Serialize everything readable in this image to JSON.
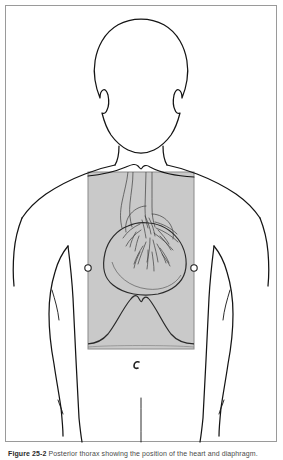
{
  "figure": {
    "caption_number": "Figure 25-2",
    "caption_text": "Posterior thorax showing the position of the heart and diaphragm.",
    "view": "posterior",
    "body_outline_color": "#1a1a1a",
    "overlay_fill": "#c9c9c9",
    "overlay_border": "#8a8a8a",
    "frame_color": "#9a9a9a",
    "background": "#ffffff",
    "anatomy": {
      "head_label": "head",
      "neck_label": "neck",
      "left_arm_label": "left arm",
      "right_arm_label": "right arm",
      "torso_label": "torso",
      "heart_label": "heart",
      "great_vessels_label": "great vessels",
      "diaphragm_label": "diaphragm"
    },
    "overlay_window": {
      "x": 88,
      "y": 172,
      "width": 106,
      "height": 177
    },
    "markers": [
      {
        "name": "electrode-marker-left",
        "x": 88,
        "y": 268,
        "r": 3.2
      },
      {
        "name": "electrode-marker-right",
        "x": 194,
        "y": 268,
        "r": 3.2
      }
    ],
    "annotation_mark": {
      "name": "apex-mark",
      "x": 137,
      "y": 365
    }
  }
}
